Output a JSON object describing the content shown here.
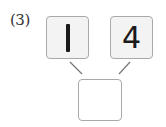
{
  "problem": {
    "label": "(3)",
    "numbers": [
      "1",
      "4"
    ],
    "answer": ""
  },
  "colors": {
    "box_border": "#a9a9a9",
    "box_fill": "#f3f3f3",
    "answer_fill": "#ffffff",
    "line": "#666666",
    "text": "#1a1a1a"
  }
}
